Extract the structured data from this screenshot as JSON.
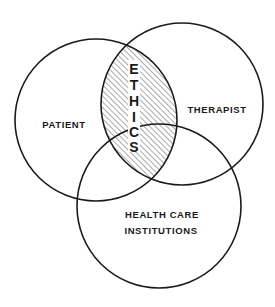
{
  "diagram": {
    "type": "venn",
    "circles": [
      {
        "id": "patient",
        "label": "PATIENT",
        "cx": 96,
        "cy": 120,
        "r": 81
      },
      {
        "id": "therapist",
        "label": "THERAPIST",
        "cx": 182,
        "cy": 104,
        "r": 81
      },
      {
        "id": "health-care",
        "label_line1": "HEALTH CARE",
        "label_line2": "INSTITUTIONS",
        "cx": 159,
        "cy": 206,
        "r": 82
      }
    ],
    "intersection": {
      "label": "ETHICS",
      "letters": [
        "E",
        "T",
        "H",
        "I",
        "C",
        "S"
      ],
      "between": [
        "patient",
        "therapist"
      ],
      "fill": "hatched"
    },
    "labels": {
      "patient": "PATIENT",
      "therapist": "THERAPIST",
      "health_care_line1": "HEALTH CARE",
      "health_care_line2": "INSTITUTIONS"
    },
    "colors": {
      "stroke": "#1a1a1a",
      "background": "#ffffff",
      "hatch": "#555555"
    }
  }
}
